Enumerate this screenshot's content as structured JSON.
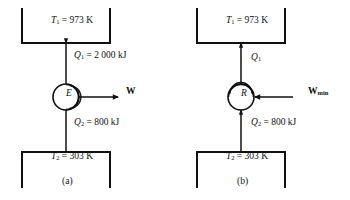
{
  "figure": {
    "ink_color": "#111111",
    "background": "#ffffff"
  },
  "panels": [
    {
      "id": "a",
      "caption": "(a)",
      "device_symbol": "E",
      "device_kind": "heat-engine",
      "rotation_arc": "clockwise-right",
      "hot_reservoir": {
        "var": "T",
        "sub": "1",
        "eq": "=",
        "value": "973 K",
        "text": "T1 = 973 K"
      },
      "cold_reservoir": {
        "var": "T",
        "sub": "2",
        "eq": "=",
        "value": "303 K",
        "text": "T2 = 303 K"
      },
      "q1": {
        "var": "Q",
        "sub": "1",
        "eq": "=",
        "value": "2 000 kJ",
        "direction": "down",
        "text": "Q1 = 2 000 kJ"
      },
      "q2": {
        "var": "Q",
        "sub": "2",
        "eq": "=",
        "value": "800 kJ",
        "direction": "down",
        "text": "Q2 = 800 kJ"
      },
      "work": {
        "var": "W",
        "sub": "",
        "direction": "out-right",
        "text": "W"
      }
    },
    {
      "id": "b",
      "caption": "(b)",
      "device_symbol": "R",
      "device_kind": "reversed-heat-engine",
      "rotation_arc": "counterclockwise-top",
      "hot_reservoir": {
        "var": "T",
        "sub": "1",
        "eq": "=",
        "value": "973 K",
        "text": "T1 = 973 K"
      },
      "cold_reservoir": {
        "var": "T",
        "sub": "2",
        "eq": "=",
        "value": "303 K",
        "text": "T2 = 303 K"
      },
      "q1": {
        "var": "Q",
        "sub": "1",
        "eq": "",
        "value": "",
        "direction": "up",
        "text": "Q1"
      },
      "q2": {
        "var": "Q",
        "sub": "2",
        "eq": "=",
        "value": "800 kJ",
        "direction": "up",
        "text": "Q2 = 800 kJ"
      },
      "work": {
        "var": "W",
        "sub": "min",
        "direction": "in-left",
        "text": "Wmin"
      }
    }
  ]
}
